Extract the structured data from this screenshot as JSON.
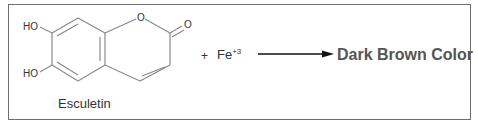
{
  "diagram": {
    "type": "chemical-reaction",
    "reactant": {
      "name": "Esculetin",
      "substituents": [
        "HO",
        "HO"
      ],
      "ring_oxygen": "O",
      "carbonyl_oxygen": "O"
    },
    "plus_sign": "+",
    "reagent": {
      "symbol": "Fe",
      "charge": "+3"
    },
    "product": "Dark Brown Color",
    "colors": {
      "border": "#6e6e6e",
      "bonds": "#888888",
      "product_text": "#555555"
    }
  }
}
